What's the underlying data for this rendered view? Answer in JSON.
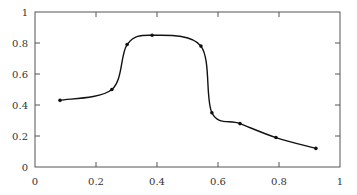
{
  "chart_data": {
    "type": "line",
    "title": "",
    "xlabel": "",
    "ylabel": "",
    "xlim": [
      0,
      1
    ],
    "ylim": [
      0,
      1
    ],
    "grid": false,
    "legend": null,
    "x_ticks": [
      "0",
      "0.2",
      "0.4",
      "0.6",
      "0.8",
      "1"
    ],
    "y_ticks": [
      "0",
      "0.2",
      "0.4",
      "0.6",
      "0.8",
      "1"
    ],
    "series": [
      {
        "name": "curve",
        "color": "#111111",
        "smooth": true,
        "markers": true,
        "x": [
          0.082,
          0.252,
          0.302,
          0.384,
          0.544,
          0.58,
          0.672,
          0.79,
          0.921
        ],
        "y": [
          0.43,
          0.5,
          0.79,
          0.85,
          0.78,
          0.35,
          0.28,
          0.19,
          0.12
        ]
      }
    ]
  }
}
